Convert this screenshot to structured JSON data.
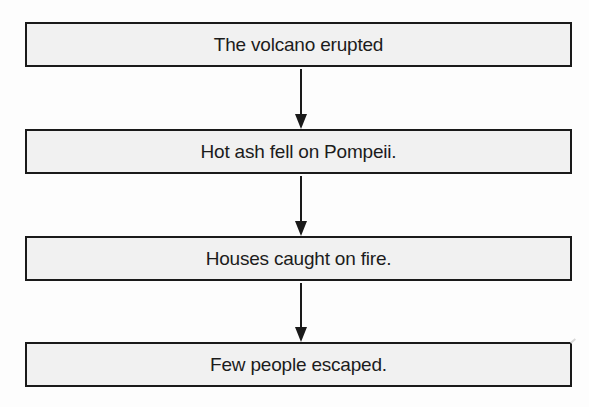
{
  "diagram": {
    "type": "flowchart",
    "direction": "top-to-bottom",
    "colors": {
      "box_fill": "#f1f1f1",
      "box_border": "#1a1a1a",
      "text": "#1c1c1c",
      "arrow": "#1a1a1a",
      "background": "#fdfdfd"
    },
    "steps": [
      {
        "label": "The volcano erupted"
      },
      {
        "label": "Hot ash fell on Pompeii."
      },
      {
        "label": "Houses caught on fire."
      },
      {
        "label": "Few people escaped."
      }
    ],
    "connections": [
      {
        "from": 0,
        "to": 1,
        "icon": "arrow-down-icon"
      },
      {
        "from": 1,
        "to": 2,
        "icon": "arrow-down-icon"
      },
      {
        "from": 2,
        "to": 3,
        "icon": "arrow-down-icon"
      }
    ]
  }
}
